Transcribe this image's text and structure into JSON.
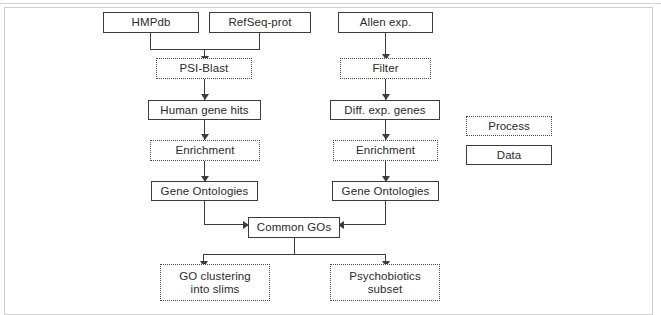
{
  "diagram": {
    "type": "flowchart",
    "title": "",
    "nodes": {
      "hmpdb": {
        "label": "HMPdb",
        "kind": "Data"
      },
      "refseq": {
        "label": "RefSeq-prot",
        "kind": "Data"
      },
      "allen": {
        "label": "Allen exp.",
        "kind": "Data"
      },
      "psiblast": {
        "label": "PSI-Blast",
        "kind": "Process"
      },
      "filter": {
        "label": "Filter",
        "kind": "Process"
      },
      "human_gene_hits": {
        "label": "Human gene hits",
        "kind": "Data"
      },
      "diff_exp_genes": {
        "label": "Diff. exp. genes",
        "kind": "Data"
      },
      "enrichment_left": {
        "label": "Enrichment",
        "kind": "Process"
      },
      "enrichment_right": {
        "label": "Enrichment",
        "kind": "Process"
      },
      "go_left": {
        "label": "Gene Ontologies",
        "kind": "Data"
      },
      "go_right": {
        "label": "Gene Ontologies",
        "kind": "Data"
      },
      "common_gos": {
        "label": "Common GOs",
        "kind": "Data"
      },
      "go_clustering": {
        "label": "GO clustering\ninto slims",
        "line1": "GO clustering",
        "line2": "into slims",
        "kind": "Process"
      },
      "psychobiotics": {
        "label": "Psychobiotics\nsubset",
        "line1": "Psychobiotics",
        "line2": "subset",
        "kind": "Process"
      }
    },
    "legend": {
      "process_label": "Process",
      "data_label": "Data"
    },
    "colors": {
      "node_border": "#3c3c3c",
      "process_border": "#4a4a4a",
      "connector": "#3c3c3c",
      "frame": "#cfcfcf",
      "text": "#2b2b2b",
      "background": "#ffffff"
    }
  }
}
